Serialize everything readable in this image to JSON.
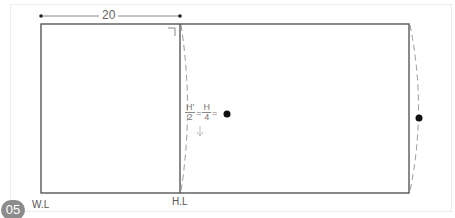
{
  "figure": {
    "step_badge": "05",
    "dimension_label": "20",
    "labels": {
      "waist_line": "W.L",
      "hip_line": "H.L"
    },
    "formula": {
      "left_num": "H'",
      "left_den": "2",
      "eq1": "=",
      "right_num": "H",
      "right_den": "4",
      "eq2": "="
    },
    "colors": {
      "line": "#4a4a4a",
      "dashed": "#9a9a9a",
      "dot": "#111111",
      "badge": "#8c8c8c"
    }
  }
}
